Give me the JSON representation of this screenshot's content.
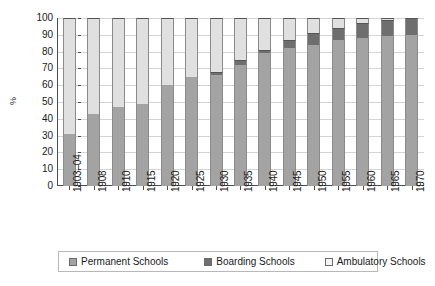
{
  "chart_data": {
    "type": "bar",
    "subtype": "stacked-bar-100",
    "title": "",
    "xlabel": "",
    "ylabel": "%",
    "ylim": [
      0,
      100
    ],
    "yticks": [
      0,
      10,
      20,
      30,
      40,
      50,
      60,
      70,
      80,
      90,
      100
    ],
    "ytick_labels": [
      "0",
      "10",
      "20",
      "30",
      "40",
      "50",
      "60",
      "70",
      "80",
      "90",
      "100"
    ],
    "grid": true,
    "grid_axis": "y",
    "legend_position": "bottom",
    "categories": [
      "1903–04",
      "1908",
      "1910",
      "1915",
      "1920",
      "1925",
      "1930",
      "1935",
      "1940",
      "1945",
      "1950",
      "1955",
      "1960",
      "1965",
      "1970"
    ],
    "series": [
      {
        "name": "Permanent Schools",
        "color": "#a3a3a3",
        "values": [
          31,
          43,
          47,
          49,
          60,
          65,
          66,
          72,
          79,
          82,
          84,
          87,
          88,
          89,
          90
        ]
      },
      {
        "name": "Boarding Schools",
        "color": "#6e6e6e",
        "values": [
          0,
          0,
          0,
          0,
          0,
          0,
          2,
          3,
          2,
          5,
          7,
          7,
          9,
          10,
          10
        ]
      },
      {
        "name": "Ambulatory Schools",
        "color": "#e0e0e0",
        "values": [
          69,
          57,
          53,
          51,
          40,
          35,
          32,
          25,
          19,
          13,
          9,
          6,
          3,
          1,
          0
        ]
      }
    ]
  },
  "legend": {
    "items": [
      {
        "label": "Permanent Schools"
      },
      {
        "label": "Boarding Schools"
      },
      {
        "label": "Ambulatory Schools"
      }
    ]
  }
}
